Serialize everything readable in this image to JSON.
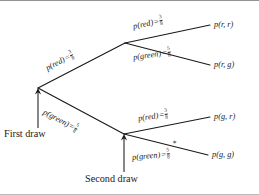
{
  "diagram": {
    "type": "probability-tree",
    "title": "",
    "root_label": "First draw",
    "second_label": "Second draw",
    "asterisk": "*",
    "branches": {
      "first_red": {
        "event": "p(red)",
        "equals": "=",
        "num": "3",
        "den": "8"
      },
      "first_green": {
        "event": "p(green)",
        "equals": "=",
        "num": "5",
        "den": "8"
      },
      "red_red": {
        "event": "p(red)",
        "equals": "=",
        "num": "3",
        "den": "8"
      },
      "red_green": {
        "event": "p(green)",
        "equals": "=",
        "num": "5",
        "den": "8"
      },
      "green_red": {
        "event": "p(red)",
        "equals": "=",
        "num": "3",
        "den": "8"
      },
      "green_green": {
        "event": "p(green)",
        "equals": "=",
        "num": "5",
        "den": "8"
      }
    },
    "outcomes": [
      {
        "id": "rr",
        "label": "p(r, r)"
      },
      {
        "id": "rg",
        "label": "p(r, g)"
      },
      {
        "id": "gr",
        "label": "p(g, r)"
      },
      {
        "id": "gg",
        "label": "p(g, g)"
      }
    ]
  }
}
